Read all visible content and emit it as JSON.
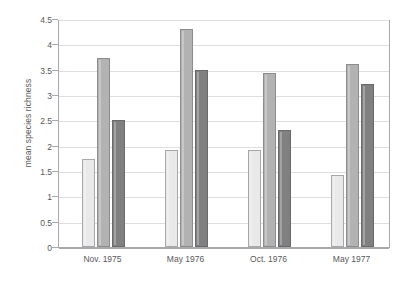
{
  "chart_data": {
    "type": "bar",
    "title": "",
    "subtitle": "",
    "xlabel": "",
    "ylabel": "mean species richness",
    "categories": [
      "Nov. 1975",
      "May 1976",
      "Oct. 1976",
      "May 1977"
    ],
    "series": [
      {
        "name": "series-1",
        "color": "#e9e9e9",
        "values": [
          1.73,
          1.92,
          1.92,
          1.43
        ]
      },
      {
        "name": "series-2",
        "color": "#b2b2b2",
        "values": [
          3.73,
          4.3,
          3.43,
          3.62
        ]
      },
      {
        "name": "series-3",
        "color": "#808080",
        "values": [
          2.51,
          3.5,
          2.31,
          3.22
        ]
      }
    ],
    "ylim": [
      0,
      4.5
    ],
    "ytick_labels": [
      "0",
      "0.5",
      "1",
      "1.5",
      "2",
      "2.5",
      "3",
      "3.5",
      "4",
      "4.5"
    ],
    "ytick_values": [
      0,
      0.5,
      1,
      1.5,
      2,
      2.5,
      3,
      3.5,
      4,
      4.5
    ],
    "grid": "horizontal",
    "legend": "none",
    "axis_color": "#a9a9ab",
    "grid_color": "#dedee0",
    "text_color": "#59595b",
    "background": "#ffffff"
  }
}
